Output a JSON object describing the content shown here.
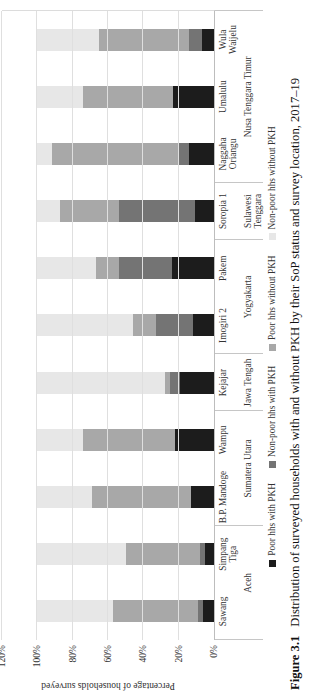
{
  "figure": {
    "label": "Figure 3.1",
    "caption": "Distribution of surveyed households with and without PKH by their SoP status and survey location, 2017–19"
  },
  "chart_data": {
    "type": "bar",
    "stacked": true,
    "note": "Rendered as a landscape chart rotated 90 degrees counter-clockwise on the page",
    "title": "",
    "ylabel": "Percentage of households surveyed",
    "ylim": [
      0,
      120
    ],
    "yticks": [
      "0%",
      "20%",
      "40%",
      "60%",
      "80%",
      "100%",
      "120%"
    ],
    "grid": "horizontal",
    "legend_position": "bottom",
    "categories": [
      {
        "name": "Sawang",
        "lines": [
          "Sawang"
        ]
      },
      {
        "name": "Simpang Tiga",
        "lines": [
          "Simpang",
          "Tiga"
        ]
      },
      {
        "name": "B.P. Mandoge",
        "lines": [
          "B.P. Mandoge"
        ]
      },
      {
        "name": "Wampu",
        "lines": [
          "Wampu"
        ]
      },
      {
        "name": "Kejajar",
        "lines": [
          "Kejajar"
        ]
      },
      {
        "name": "Imogiri 2",
        "lines": [
          "Imogiri 2"
        ]
      },
      {
        "name": "Pakem",
        "lines": [
          "Pakem"
        ]
      },
      {
        "name": "Soropia 1",
        "lines": [
          "Soropia 1"
        ]
      },
      {
        "name": "Naggaha Oriangu",
        "lines": [
          "Naggaha",
          "Oriangu"
        ]
      },
      {
        "name": "Umalulu",
        "lines": [
          "Umalulu"
        ]
      },
      {
        "name": "Wula Waijelu",
        "lines": [
          "Wula",
          "Waijelu"
        ]
      }
    ],
    "groups": [
      {
        "province": "Aceh",
        "lines": [
          "Aceh"
        ],
        "span": 2
      },
      {
        "province": "Sumatera Utara",
        "lines": [
          "Sumatera Utara"
        ],
        "span": 2
      },
      {
        "province": "Jawa Tengah",
        "lines": [
          "Jawa Tengah"
        ],
        "span": 1
      },
      {
        "province": "Yogyakarta",
        "lines": [
          "Yogyakarta"
        ],
        "span": 2
      },
      {
        "province": "Sulawesi Tenggara",
        "lines": [
          "Sulawesi",
          "Tenggara"
        ],
        "span": 1
      },
      {
        "province": "Nusa Tenggara Timur",
        "lines": [
          "Nusa Tenggara Timur"
        ],
        "span": 3
      }
    ],
    "series": [
      {
        "name": "Poor hhs with PKH",
        "color": "#1c1c1c",
        "values": [
          6,
          5,
          13,
          22,
          19,
          12,
          24,
          11,
          14,
          23,
          7
        ]
      },
      {
        "name": "Non-poor hhs with PKH",
        "color": "#747474",
        "values": [
          3,
          3,
          0,
          0,
          6,
          21,
          30,
          43,
          6,
          0,
          7
        ]
      },
      {
        "name": "Poor hhs without PKH",
        "color": "#a8a8a8",
        "values": [
          48,
          42,
          56,
          52,
          3,
          13,
          13,
          33,
          72,
          51,
          51
        ]
      },
      {
        "name": "Non-poor hhs without PKH",
        "color": "#e7e7e7",
        "values": [
          43,
          50,
          31,
          26,
          72,
          54,
          33,
          13,
          8,
          26,
          35
        ]
      }
    ]
  },
  "colors": {
    "gridline": "#dfdfdf",
    "axis_line": "#bdbdbd",
    "separator": "#c6c6c6"
  }
}
